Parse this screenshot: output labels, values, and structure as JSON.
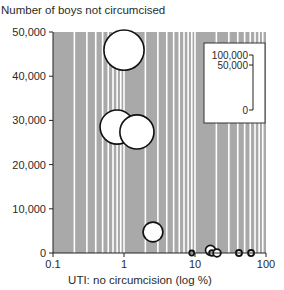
{
  "chart_data": {
    "type": "scatter",
    "subtype": "bubble",
    "title": "",
    "ylabel": "Number of boys not circumcised",
    "xlabel": "UTI: no circumcision (log %)",
    "xscale": "log",
    "xlim": [
      0.1,
      100
    ],
    "ylim": [
      0,
      50000
    ],
    "xticks": [
      0.1,
      1,
      10,
      100
    ],
    "xtick_labels": [
      "0.1",
      "1",
      "10",
      "100"
    ],
    "yticks": [
      0,
      10000,
      20000,
      30000,
      40000,
      50000
    ],
    "ytick_labels": [
      "0",
      "10,000",
      "20,000",
      "30,000",
      "40,000",
      "50,000"
    ],
    "grid": "log vertical white lines on grey background",
    "background_color": "#a9a9a9",
    "gridline_color": "#ffffff",
    "bubble_fill": "#ffffff",
    "bubble_stroke": "#111111",
    "size_legend": {
      "position": "upper right inset",
      "labels": [
        "100,000",
        "50,000",
        "0"
      ],
      "values": [
        100000,
        50000,
        0
      ]
    },
    "points": [
      {
        "x": 1.0,
        "y": 45900,
        "size": 73000
      },
      {
        "x": 0.8,
        "y": 28500,
        "size": 62000
      },
      {
        "x": 1.52,
        "y": 27400,
        "size": 62000
      },
      {
        "x": 2.56,
        "y": 4750,
        "size": 36000
      },
      {
        "x": 9.0,
        "y": 0,
        "size": 9000
      },
      {
        "x": 16.5,
        "y": 600,
        "size": 18000
      },
      {
        "x": 17.3,
        "y": 0,
        "size": 10000
      },
      {
        "x": 20.4,
        "y": 0,
        "size": 14000
      },
      {
        "x": 41.6,
        "y": 0,
        "size": 11000
      },
      {
        "x": 61.6,
        "y": 0,
        "size": 11000
      }
    ]
  }
}
